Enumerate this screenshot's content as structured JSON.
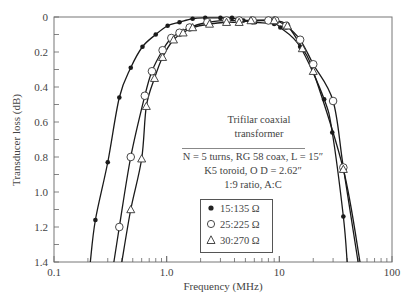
{
  "chart_data": {
    "type": "line",
    "title": "",
    "xlabel": "Frequency (MHz)",
    "ylabel": "Transducer loss (dB)",
    "xscale": "log",
    "xlim": [
      0.1,
      100
    ],
    "ylim": [
      0,
      1.4
    ],
    "y_inverted": true,
    "x_ticks": [
      "0.1",
      "1.0",
      "10",
      "100"
    ],
    "y_ticks": [
      "0",
      "0.2",
      "0.4",
      "0.6",
      "0.8",
      "1.0",
      "1.2",
      "1.4"
    ],
    "grid": false,
    "legend_position": "lower center (inside plot)",
    "annotation": {
      "title_line1": "Trifilar coaxial",
      "title_line2": "transformer",
      "line1": "N = 5 turns, RG 58 coax, L = 15″",
      "line2": "K5 toroid, O D = 2.62″",
      "line3": "1:9 ratio, A:C"
    },
    "series": [
      {
        "name": "15:135 Ω",
        "marker": "filled-circle",
        "x": [
          0.21,
          0.233,
          0.3,
          0.38,
          0.48,
          0.61,
          0.8,
          1.02,
          1.3,
          1.7,
          2.2,
          3.0,
          3.8,
          4.8,
          6.1,
          9.0,
          10.2,
          15.3,
          25,
          29.5,
          37,
          40
        ],
        "y": [
          1.4,
          1.16,
          0.83,
          0.46,
          0.29,
          0.17,
          0.1,
          0.05,
          0.03,
          0.01,
          0.005,
          0.005,
          0.005,
          0.02,
          0.03,
          0.04,
          0.06,
          0.17,
          0.47,
          0.66,
          1.14,
          1.4
        ]
      },
      {
        "name": "25:225 Ω",
        "marker": "open-circle",
        "x": [
          0.34,
          0.38,
          0.48,
          0.64,
          0.74,
          0.92,
          1.1,
          1.3,
          1.6,
          2.3,
          3.4,
          4.4,
          5.8,
          8.0,
          9.2,
          11.5,
          15.3,
          20,
          30,
          37,
          50
        ],
        "y": [
          1.4,
          1.2,
          0.8,
          0.45,
          0.31,
          0.19,
          0.12,
          0.09,
          0.06,
          0.03,
          0.02,
          0.02,
          0.02,
          0.02,
          0.02,
          0.05,
          0.13,
          0.27,
          0.48,
          0.86,
          1.4
        ]
      },
      {
        "name": "30:270 Ω",
        "marker": "open-triangle",
        "x": [
          0.4,
          0.48,
          0.6,
          0.66,
          0.78,
          0.92,
          1.15,
          1.4,
          1.7,
          2.4,
          3.4,
          4.4,
          5.6,
          9.0,
          11.8,
          16,
          20,
          37,
          52
        ],
        "y": [
          1.4,
          1.1,
          0.81,
          0.51,
          0.35,
          0.23,
          0.13,
          0.09,
          0.06,
          0.04,
          0.03,
          0.03,
          0.02,
          0.02,
          0.05,
          0.18,
          0.31,
          0.87,
          1.4
        ]
      }
    ]
  }
}
